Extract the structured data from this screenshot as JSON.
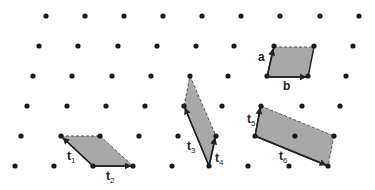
{
  "diagram": {
    "type": "2d-lattice-unit-cells",
    "colors": {
      "dot": "#1a1a1a",
      "fill": "#a8a8a8",
      "edge": "#222222",
      "dashed_edge": "#555555"
    },
    "lattice_rows": [
      {
        "y": 16,
        "x": [
          46,
          85,
          124,
          163,
          202,
          241,
          280,
          320,
          359
        ]
      },
      {
        "y": 46,
        "x": [
          39,
          78,
          118,
          157,
          196,
          234,
          274,
          314,
          353
        ]
      },
      {
        "y": 76,
        "x": [
          33,
          72,
          112,
          151,
          190,
          228,
          267,
          308,
          346
        ]
      },
      {
        "y": 106,
        "x": [
          27,
          67,
          106,
          145,
          184,
          222,
          261,
          302,
          340
        ]
      },
      {
        "y": 136,
        "x": [
          21,
          61,
          100,
          139,
          178,
          216,
          255,
          295,
          334
        ]
      },
      {
        "y": 166,
        "x": [
          15,
          54,
          93,
          133,
          172,
          209,
          248,
          289,
          328
        ]
      }
    ],
    "cells": [
      {
        "name": "cell-ab",
        "polygon": [
          [
            267,
            77
          ],
          [
            308,
            77
          ],
          [
            314,
            47
          ],
          [
            274,
            47
          ]
        ],
        "solid_edges": [
          [
            [
              267,
              77
            ],
            [
              274,
              47
            ]
          ],
          [
            [
              267,
              77
            ],
            [
              308,
              77
            ]
          ],
          [
            [
              308,
              77
            ],
            [
              314,
              47
            ]
          ]
        ],
        "dashed_edges": [
          [
            [
              274,
              47
            ],
            [
              314,
              47
            ]
          ]
        ],
        "vectors": [
          {
            "id": "a",
            "from": [
              267,
              77
            ],
            "to": [
              273,
              49
            ]
          },
          {
            "id": "b",
            "from": [
              267,
              77
            ],
            "to": [
              306,
              77
            ]
          }
        ]
      },
      {
        "name": "cell-t1-t2",
        "polygon": [
          [
            93,
            166
          ],
          [
            133,
            166
          ],
          [
            100,
            136
          ],
          [
            61,
            136
          ]
        ],
        "solid_edges": [
          [
            [
              93,
              166
            ],
            [
              61,
              136
            ]
          ],
          [
            [
              93,
              166
            ],
            [
              133,
              166
            ]
          ]
        ],
        "dashed_edges": [
          [
            [
              61,
              136
            ],
            [
              100,
              136
            ]
          ],
          [
            [
              100,
              136
            ],
            [
              133,
              166
            ]
          ]
        ],
        "vectors": [
          {
            "id": "t1",
            "from": [
              93,
              166
            ],
            "to": [
              63,
              138
            ]
          },
          {
            "id": "t2",
            "from": [
              93,
              166
            ],
            "to": [
              131,
              166
            ]
          }
        ]
      },
      {
        "name": "cell-t3-t4",
        "polygon": [
          [
            209,
            166
          ],
          [
            216,
            136
          ],
          [
            190,
            76
          ],
          [
            184,
            106
          ]
        ],
        "solid_edges": [
          [
            [
              209,
              166
            ],
            [
              184,
              106
            ]
          ],
          [
            [
              209,
              166
            ],
            [
              216,
              136
            ]
          ]
        ],
        "dashed_edges": [
          [
            [
              184,
              106
            ],
            [
              190,
              76
            ]
          ],
          [
            [
              190,
              76
            ],
            [
              216,
              136
            ]
          ]
        ],
        "vectors": [
          {
            "id": "t3",
            "from": [
              209,
              166
            ],
            "to": [
              185,
              108
            ]
          },
          {
            "id": "t4",
            "from": [
              209,
              166
            ],
            "to": [
              215,
              138
            ]
          }
        ]
      },
      {
        "name": "cell-t5-t6",
        "polygon": [
          [
            255,
            136
          ],
          [
            261,
            106
          ],
          [
            334,
            136
          ],
          [
            328,
            166
          ]
        ],
        "solid_edges": [
          [
            [
              255,
              136
            ],
            [
              261,
              106
            ]
          ],
          [
            [
              255,
              136
            ],
            [
              328,
              166
            ]
          ]
        ],
        "dashed_edges": [
          [
            [
              261,
              106
            ],
            [
              334,
              136
            ]
          ],
          [
            [
              334,
              136
            ],
            [
              328,
              166
            ]
          ]
        ],
        "vectors": [
          {
            "id": "t5",
            "from": [
              255,
              136
            ],
            "to": [
              260,
              108
            ]
          },
          {
            "id": "t6",
            "from": [
              255,
              136
            ],
            "to": [
              326,
              165
            ]
          }
        ]
      }
    ],
    "labels": [
      {
        "id": "a",
        "base": "a",
        "sub": "",
        "x": 258,
        "y": 51
      },
      {
        "id": "b",
        "base": "b",
        "sub": "",
        "x": 283,
        "y": 80
      },
      {
        "id": "t1",
        "base": "t",
        "sub": "1",
        "x": 67,
        "y": 150
      },
      {
        "id": "t2",
        "base": "t",
        "sub": "2",
        "x": 106,
        "y": 170
      },
      {
        "id": "t3",
        "base": "t",
        "sub": "3",
        "x": 187,
        "y": 140
      },
      {
        "id": "t4",
        "base": "t",
        "sub": "4",
        "x": 215,
        "y": 152
      },
      {
        "id": "t5",
        "base": "t",
        "sub": "5",
        "x": 247,
        "y": 113
      },
      {
        "id": "t6",
        "base": "t",
        "sub": "6",
        "x": 279,
        "y": 150
      }
    ]
  }
}
